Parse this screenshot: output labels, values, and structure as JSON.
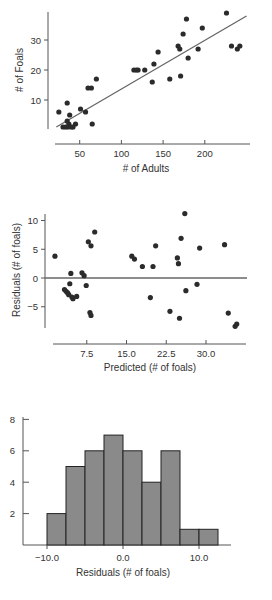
{
  "chart_data": [
    {
      "type": "scatter",
      "title": "",
      "xlabel": "# of Adults",
      "ylabel": "# of Foals",
      "xticks": [
        50,
        100,
        150,
        200
      ],
      "yticks": [
        10,
        20,
        30
      ],
      "xlim": [
        20,
        250
      ],
      "ylim": [
        0,
        40
      ],
      "grid": false,
      "regression_line": {
        "x1": 22,
        "y1": 1,
        "x2": 250,
        "y2": 38
      },
      "points": [
        [
          25,
          6
        ],
        [
          30,
          1
        ],
        [
          33,
          1
        ],
        [
          35,
          9
        ],
        [
          35,
          3
        ],
        [
          36,
          1
        ],
        [
          37,
          2
        ],
        [
          38,
          5
        ],
        [
          40,
          1
        ],
        [
          42,
          1
        ],
        [
          45,
          2
        ],
        [
          51,
          7
        ],
        [
          57,
          6
        ],
        [
          60,
          14
        ],
        [
          64,
          14
        ],
        [
          65,
          2
        ],
        [
          70,
          17
        ],
        [
          115,
          20
        ],
        [
          118,
          20
        ],
        [
          120,
          20
        ],
        [
          128,
          20
        ],
        [
          137,
          16
        ],
        [
          139,
          22
        ],
        [
          144,
          26
        ],
        [
          158,
          17
        ],
        [
          168,
          28
        ],
        [
          170,
          27
        ],
        [
          171,
          18
        ],
        [
          174,
          32
        ],
        [
          178,
          37
        ],
        [
          180,
          24
        ],
        [
          192,
          27
        ],
        [
          197,
          34
        ],
        [
          226,
          39
        ],
        [
          232,
          28
        ],
        [
          239,
          27
        ],
        [
          242,
          28
        ]
      ]
    },
    {
      "type": "scatter",
      "title": "",
      "xlabel": "Predicted (# of foals)",
      "ylabel": "Residuals (# of foals)",
      "xticks": [
        "7.5",
        "15.0",
        "22.5",
        "30.0"
      ],
      "yticks": [
        "10",
        "5",
        "0",
        "-5"
      ],
      "xlim": [
        1,
        37
      ],
      "ylim": [
        -9,
        12
      ],
      "reference_line_y": 0,
      "grid": false,
      "points": [
        [
          1.5,
          3.8
        ],
        [
          3.3,
          -2.0
        ],
        [
          3.6,
          -2.3
        ],
        [
          3.9,
          -2.6
        ],
        [
          4.1,
          -2.9
        ],
        [
          4.3,
          -1.0
        ],
        [
          4.5,
          0.8
        ],
        [
          4.7,
          -3.3
        ],
        [
          4.9,
          -3.6
        ],
        [
          5.6,
          -3.2
        ],
        [
          6.6,
          0.9
        ],
        [
          7.0,
          0.4
        ],
        [
          7.4,
          -1.3
        ],
        [
          7.8,
          6.3
        ],
        [
          8.3,
          5.6
        ],
        [
          8.1,
          -6.0
        ],
        [
          8.3,
          -6.5
        ],
        [
          9.0,
          8.0
        ],
        [
          16.0,
          3.8
        ],
        [
          16.5,
          3.3
        ],
        [
          18.0,
          2.0
        ],
        [
          19.5,
          -3.4
        ],
        [
          20.0,
          2.0
        ],
        [
          20.5,
          5.6
        ],
        [
          23.2,
          -5.8
        ],
        [
          24.6,
          3.5
        ],
        [
          24.8,
          2.5
        ],
        [
          25.0,
          -7.0
        ],
        [
          25.3,
          6.9
        ],
        [
          26.0,
          11.2
        ],
        [
          26.2,
          -2.2
        ],
        [
          28.3,
          -1.1
        ],
        [
          28.8,
          5.2
        ],
        [
          33.5,
          5.8
        ],
        [
          34.2,
          -6.1
        ],
        [
          35.5,
          -8.4
        ],
        [
          35.8,
          -8.0
        ]
      ]
    },
    {
      "type": "bar",
      "subtype": "histogram",
      "title": "",
      "xlabel": "Residuals (# of foals)",
      "ylabel": "",
      "xticks": [
        "-10.0",
        "0.0",
        "10.0"
      ],
      "yticks": [
        "2",
        "4",
        "6",
        "8"
      ],
      "bin_width": 2.5,
      "bin_edges": [
        -10.0,
        -7.5,
        -5.0,
        -2.5,
        0.0,
        2.5,
        5.0,
        7.5,
        10.0,
        12.5
      ],
      "categories": [
        "-10.0 to -7.5",
        "-7.5 to -5.0",
        "-5.0 to -2.5",
        "-2.5 to 0.0",
        "0.0 to 2.5",
        "2.5 to 5.0",
        "5.0 to 7.5",
        "7.5 to 10.0",
        "10.0 to 12.5"
      ],
      "values": [
        2,
        5,
        6,
        7,
        6,
        4,
        6,
        1,
        1
      ],
      "ylim": [
        0,
        8
      ],
      "grid": false
    }
  ]
}
